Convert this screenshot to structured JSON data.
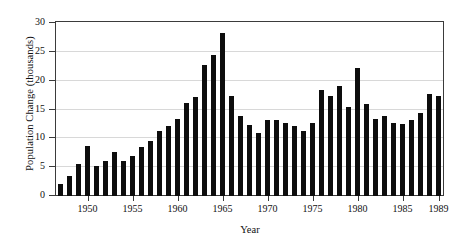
{
  "chart_data": {
    "type": "bar",
    "title": "",
    "xlabel": "Year",
    "ylabel": "Population Change (thousands)",
    "xlim": [
      1946.5,
      1989.5
    ],
    "ylim": [
      0,
      30
    ],
    "grid": true,
    "legend": null,
    "bar_color": "#0d0d0d",
    "xticks": [
      1950,
      1955,
      1960,
      1965,
      1970,
      1975,
      1980,
      1985,
      1989
    ],
    "xtick_labels": [
      "1950",
      "1955",
      "1960",
      "1965",
      "1970",
      "1975",
      "1980",
      "1985",
      "1989"
    ],
    "yticks": [
      0,
      5,
      10,
      15,
      20,
      25,
      30
    ],
    "ytick_labels": [
      "0",
      "5",
      "10",
      "15",
      "20",
      "25",
      "30"
    ],
    "categories": [
      "1947",
      "1948",
      "1949",
      "1950",
      "1951",
      "1952",
      "1953",
      "1954",
      "1955",
      "1956",
      "1957",
      "1958",
      "1959",
      "1960",
      "1961",
      "1962",
      "1963",
      "1964",
      "1965",
      "1966",
      "1967",
      "1968",
      "1969",
      "1970",
      "1971",
      "1972",
      "1973",
      "1974",
      "1975",
      "1976",
      "1977",
      "1978",
      "1979",
      "1980",
      "1981",
      "1982",
      "1983",
      "1984",
      "1985",
      "1986",
      "1987",
      "1988",
      "1989"
    ],
    "values": [
      2.1,
      3.4,
      5.5,
      8.6,
      5.2,
      6.0,
      7.7,
      6.1,
      7.0,
      8.5,
      9.6,
      11.2,
      12.2,
      13.4,
      16.1,
      17.1,
      22.8,
      24.5,
      28.2,
      17.3,
      13.8,
      12.4,
      11.0,
      13.2,
      13.1,
      12.6,
      12.1,
      11.3,
      12.6,
      18.4,
      17.4,
      19.0,
      15.4,
      22.2,
      16.0,
      13.3,
      13.8,
      12.7,
      12.5,
      13.1,
      14.4,
      17.7,
      17.4
    ]
  }
}
